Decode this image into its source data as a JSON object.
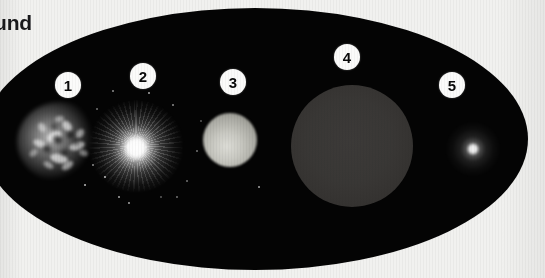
{
  "figure": {
    "caption_fragment": "und",
    "background_color": "#f1f1ef",
    "field_color": "#040404",
    "badge_fill": "#fbfbfa",
    "badge_text_color": "#0a0a0a"
  },
  "objects": [
    {
      "number": "1",
      "name": "supernova-remnant",
      "description": "clumpy filamentary nebula",
      "badge_x": 68,
      "badge_y": 85,
      "center_x": 60,
      "center_y": 142,
      "size_px": 86,
      "tone": "#ffffff"
    },
    {
      "number": "2",
      "name": "bright-star-with-rays",
      "description": "brilliant core with radial rays",
      "badge_x": 143,
      "badge_y": 76,
      "center_x": 136,
      "center_y": 146,
      "size_px": 96,
      "tone": "#ffffff"
    },
    {
      "number": "3",
      "name": "grey-sphere",
      "description": "medium soft-edged grey disc",
      "badge_x": 233,
      "badge_y": 82,
      "center_x": 230,
      "center_y": 140,
      "size_px": 54,
      "tone": "#c9c9c2"
    },
    {
      "number": "4",
      "name": "large-dim-disc",
      "description": "large faint dark-grey disc",
      "badge_x": 347,
      "badge_y": 57,
      "center_x": 352,
      "center_y": 146,
      "size_px": 122,
      "tone": "#393735"
    },
    {
      "number": "5",
      "name": "compact-bright-point",
      "description": "small brilliant point with faint halo",
      "badge_x": 452,
      "badge_y": 85,
      "center_x": 473,
      "center_y": 149,
      "size_px": 56,
      "tone": "#ffffff"
    }
  ],
  "nebula_wisps": [
    {
      "x": 30,
      "y": 30,
      "w": 15,
      "h": 9,
      "r": -28,
      "o": 0.8
    },
    {
      "x": 16,
      "y": 38,
      "w": 13,
      "h": 7,
      "r": 22,
      "o": 0.7
    },
    {
      "x": 44,
      "y": 20,
      "w": 12,
      "h": 8,
      "r": 48,
      "o": 0.75
    },
    {
      "x": 52,
      "y": 40,
      "w": 16,
      "h": 8,
      "r": -18,
      "o": 0.72
    },
    {
      "x": 33,
      "y": 52,
      "w": 18,
      "h": 9,
      "r": 12,
      "o": 0.78
    },
    {
      "x": 20,
      "y": 22,
      "w": 10,
      "h": 7,
      "r": 62,
      "o": 0.58
    },
    {
      "x": 58,
      "y": 28,
      "w": 10,
      "h": 7,
      "r": -52,
      "o": 0.6
    },
    {
      "x": 44,
      "y": 60,
      "w": 13,
      "h": 7,
      "r": -34,
      "o": 0.62
    },
    {
      "x": 26,
      "y": 60,
      "w": 11,
      "h": 6,
      "r": 30,
      "o": 0.55
    },
    {
      "x": 62,
      "y": 48,
      "w": 9,
      "h": 6,
      "r": 20,
      "o": 0.5
    },
    {
      "x": 38,
      "y": 14,
      "w": 9,
      "h": 6,
      "r": -10,
      "o": 0.5
    },
    {
      "x": 12,
      "y": 48,
      "w": 9,
      "h": 6,
      "r": -40,
      "o": 0.46
    }
  ],
  "nebula_voids": [
    {
      "x": 36,
      "y": 34,
      "w": 9,
      "h": 7,
      "r": 18,
      "o": 0.85
    },
    {
      "x": 50,
      "y": 30,
      "w": 7,
      "h": 6,
      "r": -22,
      "o": 0.8
    },
    {
      "x": 26,
      "y": 44,
      "w": 8,
      "h": 6,
      "r": 34,
      "o": 0.78
    },
    {
      "x": 44,
      "y": 48,
      "w": 7,
      "h": 5,
      "r": -14,
      "o": 0.75
    },
    {
      "x": 34,
      "y": 22,
      "w": 6,
      "h": 5,
      "r": 40,
      "o": 0.7
    },
    {
      "x": 56,
      "y": 38,
      "w": 6,
      "h": 5,
      "r": 10,
      "o": 0.66
    }
  ],
  "field_sparks": [
    {
      "x": 104,
      "y": 176
    },
    {
      "x": 118,
      "y": 196
    },
    {
      "x": 96,
      "y": 108
    },
    {
      "x": 172,
      "y": 104
    },
    {
      "x": 186,
      "y": 180
    },
    {
      "x": 160,
      "y": 196
    },
    {
      "x": 84,
      "y": 184
    },
    {
      "x": 200,
      "y": 120
    },
    {
      "x": 148,
      "y": 92
    },
    {
      "x": 112,
      "y": 90
    },
    {
      "x": 176,
      "y": 196
    },
    {
      "x": 92,
      "y": 164
    },
    {
      "x": 258,
      "y": 186
    },
    {
      "x": 196,
      "y": 150
    },
    {
      "x": 128,
      "y": 202
    }
  ]
}
